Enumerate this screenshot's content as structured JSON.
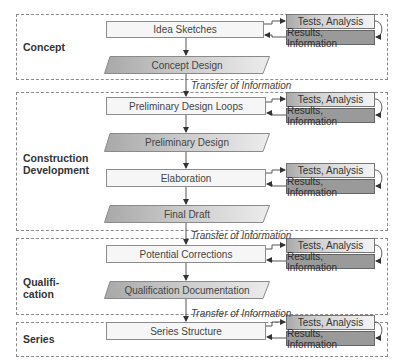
{
  "phases": [
    {
      "label": "Concept"
    },
    {
      "label": "Construction Development"
    },
    {
      "label": "Qualifi-\ncation"
    },
    {
      "label": "Series"
    }
  ],
  "steps": {
    "idea_sketches": "Idea Sketches",
    "concept_design": "Concept Design",
    "preliminary_design_loops": "Preliminary Design Loops",
    "preliminary_design": "Preliminary Design",
    "elaboration": "Elaboration",
    "final_draft": "Final Draft",
    "potential_corrections": "Potential Corrections",
    "qualification_documentation": "Qualification Documentation",
    "series_structure": "Series Structure"
  },
  "feedback": {
    "tests": "Tests, Analysis",
    "results": "Results, Information"
  },
  "transfer_label": "Transfer of Information",
  "colors": {
    "frame": "#8a8a8a",
    "box_fill": "#f6f6f6",
    "output_fill": "#c8c8c8",
    "results_fill": "#9a9a9a"
  }
}
